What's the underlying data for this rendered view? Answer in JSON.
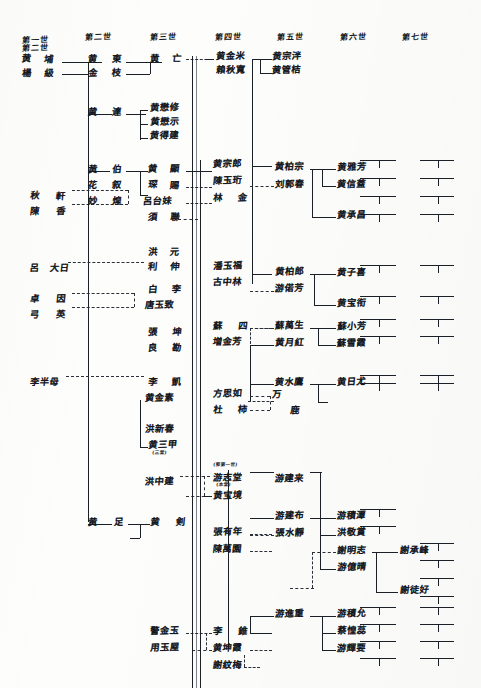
{
  "document": {
    "type": "handwritten-genealogy-chart",
    "script": "Chinese",
    "ink_color": "#1b1f28",
    "paper_color": "#fdfdfb"
  },
  "generation_headers": [
    {
      "label": "第一世",
      "x": 22,
      "y": 36
    },
    {
      "label": "第二世",
      "x": 22,
      "y": 44
    },
    {
      "label": "第二世",
      "x": 85,
      "y": 33
    },
    {
      "label": "第三世",
      "x": 150,
      "y": 33
    },
    {
      "label": "第四世",
      "x": 215,
      "y": 33
    },
    {
      "label": "第五世",
      "x": 277,
      "y": 33
    },
    {
      "label": "第六世",
      "x": 340,
      "y": 33
    },
    {
      "label": "第七世",
      "x": 402,
      "y": 33
    }
  ],
  "names": [
    {
      "text": "黄",
      "x": 22,
      "y": 55
    },
    {
      "text": "埔",
      "x": 44,
      "y": 55
    },
    {
      "text": "楊",
      "x": 22,
      "y": 69
    },
    {
      "text": "級",
      "x": 44,
      "y": 69
    },
    {
      "text": "黄",
      "x": 88,
      "y": 55
    },
    {
      "text": "東",
      "x": 112,
      "y": 55
    },
    {
      "text": "金",
      "x": 88,
      "y": 69
    },
    {
      "text": "枝",
      "x": 112,
      "y": 69
    },
    {
      "text": "黄",
      "x": 150,
      "y": 55
    },
    {
      "text": "亡",
      "x": 172,
      "y": 55
    },
    {
      "text": "黄宗泮",
      "x": 272,
      "y": 52
    },
    {
      "text": "黄管桔",
      "x": 272,
      "y": 66
    },
    {
      "text": "黄金米",
      "x": 216,
      "y": 52
    },
    {
      "text": "賴秋寬",
      "x": 216,
      "y": 66
    },
    {
      "text": "黄",
      "x": 88,
      "y": 108
    },
    {
      "text": "連",
      "x": 112,
      "y": 108
    },
    {
      "text": "黄懋修",
      "x": 150,
      "y": 104
    },
    {
      "text": "黄懋示",
      "x": 150,
      "y": 118
    },
    {
      "text": "黄得建",
      "x": 150,
      "y": 132
    },
    {
      "text": "黄",
      "x": 88,
      "y": 165
    },
    {
      "text": "伯",
      "x": 112,
      "y": 165
    },
    {
      "text": "花",
      "x": 88,
      "y": 181
    },
    {
      "text": "叙",
      "x": 112,
      "y": 181
    },
    {
      "text": "妙",
      "x": 88,
      "y": 197
    },
    {
      "text": "煌",
      "x": 112,
      "y": 197
    },
    {
      "text": "黄",
      "x": 148,
      "y": 165
    },
    {
      "text": "顯",
      "x": 170,
      "y": 165
    },
    {
      "text": "琛",
      "x": 148,
      "y": 181
    },
    {
      "text": "賜",
      "x": 170,
      "y": 181
    },
    {
      "text": "呂台妹",
      "x": 143,
      "y": 197
    },
    {
      "text": "須",
      "x": 148,
      "y": 213
    },
    {
      "text": "聯",
      "x": 170,
      "y": 213
    },
    {
      "text": "黄宗郎",
      "x": 213,
      "y": 160
    },
    {
      "text": "陳玉珩",
      "x": 213,
      "y": 177
    },
    {
      "text": "林",
      "x": 213,
      "y": 194
    },
    {
      "text": "金",
      "x": 238,
      "y": 194
    },
    {
      "text": "黄柏宗",
      "x": 275,
      "y": 163
    },
    {
      "text": "刘郭春",
      "x": 275,
      "y": 180
    },
    {
      "text": "黄雅芳",
      "x": 337,
      "y": 163
    },
    {
      "text": "黄信蓋",
      "x": 337,
      "y": 180
    },
    {
      "text": "黄承昌",
      "x": 337,
      "y": 211
    },
    {
      "text": "洪",
      "x": 148,
      "y": 248
    },
    {
      "text": "元",
      "x": 170,
      "y": 248
    },
    {
      "text": "利",
      "x": 148,
      "y": 263
    },
    {
      "text": "伸",
      "x": 170,
      "y": 263
    },
    {
      "text": "秋",
      "x": 30,
      "y": 192
    },
    {
      "text": "軒",
      "x": 56,
      "y": 192
    },
    {
      "text": "陳",
      "x": 30,
      "y": 207
    },
    {
      "text": "香",
      "x": 56,
      "y": 207
    },
    {
      "text": "呂",
      "x": 30,
      "y": 264
    },
    {
      "text": "大日",
      "x": 50,
      "y": 264
    },
    {
      "text": "卓",
      "x": 30,
      "y": 295
    },
    {
      "text": "因",
      "x": 56,
      "y": 295
    },
    {
      "text": "弓",
      "x": 30,
      "y": 311
    },
    {
      "text": "英",
      "x": 56,
      "y": 311
    },
    {
      "text": "白",
      "x": 148,
      "y": 285
    },
    {
      "text": "李",
      "x": 172,
      "y": 285
    },
    {
      "text": "唐玉致",
      "x": 145,
      "y": 301
    },
    {
      "text": "張",
      "x": 148,
      "y": 328
    },
    {
      "text": "坤",
      "x": 172,
      "y": 328
    },
    {
      "text": "良",
      "x": 148,
      "y": 344
    },
    {
      "text": "勘",
      "x": 172,
      "y": 344
    },
    {
      "text": "黄柏郎",
      "x": 275,
      "y": 268
    },
    {
      "text": "游偌芳",
      "x": 275,
      "y": 285
    },
    {
      "text": "黄子喜",
      "x": 337,
      "y": 268
    },
    {
      "text": "黄宝衔",
      "x": 337,
      "y": 299
    },
    {
      "text": "潘玉福",
      "x": 213,
      "y": 262
    },
    {
      "text": "古中林",
      "x": 213,
      "y": 278
    },
    {
      "text": "蘇",
      "x": 213,
      "y": 322
    },
    {
      "text": "四",
      "x": 238,
      "y": 322
    },
    {
      "text": "増金芳",
      "x": 213,
      "y": 338
    },
    {
      "text": "蘇萬生",
      "x": 275,
      "y": 322
    },
    {
      "text": "黄月紅",
      "x": 275,
      "y": 339
    },
    {
      "text": "蘇小芳",
      "x": 337,
      "y": 322
    },
    {
      "text": "蘇雪霞",
      "x": 337,
      "y": 339
    },
    {
      "text": "李半母",
      "x": 30,
      "y": 378
    },
    {
      "text": "李",
      "x": 148,
      "y": 378
    },
    {
      "text": "凱",
      "x": 172,
      "y": 378
    },
    {
      "text": "黄金素",
      "x": 145,
      "y": 394
    },
    {
      "text": "方思如",
      "x": 213,
      "y": 390
    },
    {
      "text": "杜",
      "x": 213,
      "y": 406
    },
    {
      "text": "柿",
      "x": 238,
      "y": 406
    },
    {
      "text": "万",
      "x": 272,
      "y": 390
    },
    {
      "text": "鹿",
      "x": 290,
      "y": 406
    },
    {
      "text": "黄水鷹",
      "x": 275,
      "y": 378
    },
    {
      "text": "黄日尤",
      "x": 337,
      "y": 378
    },
    {
      "text": "洪新春",
      "x": 145,
      "y": 425
    },
    {
      "text": "黄三甲",
      "x": 148,
      "y": 441
    },
    {
      "text": "洪中建",
      "x": 145,
      "y": 478
    },
    {
      "text": "游志堂",
      "x": 213,
      "y": 474
    },
    {
      "text": "黄宝境",
      "x": 213,
      "y": 492
    },
    {
      "text": "游建来",
      "x": 275,
      "y": 474
    },
    {
      "text": "黄",
      "x": 88,
      "y": 518
    },
    {
      "text": "足",
      "x": 114,
      "y": 518
    },
    {
      "text": "黄",
      "x": 150,
      "y": 518
    },
    {
      "text": "剣",
      "x": 176,
      "y": 518
    },
    {
      "text": "游建布",
      "x": 275,
      "y": 512
    },
    {
      "text": "張水靜",
      "x": 275,
      "y": 529
    },
    {
      "text": "游積潭",
      "x": 337,
      "y": 512
    },
    {
      "text": "洪敬賞",
      "x": 337,
      "y": 529
    },
    {
      "text": "謝明志",
      "x": 337,
      "y": 546
    },
    {
      "text": "游億晴",
      "x": 337,
      "y": 563
    },
    {
      "text": "謝承峰",
      "x": 400,
      "y": 546
    },
    {
      "text": "謝徒好",
      "x": 400,
      "y": 586
    },
    {
      "text": "張有年",
      "x": 213,
      "y": 528
    },
    {
      "text": "陳萬園",
      "x": 213,
      "y": 545
    },
    {
      "text": "游進重",
      "x": 275,
      "y": 610
    },
    {
      "text": "游積允",
      "x": 337,
      "y": 610
    },
    {
      "text": "蔡惶蕊",
      "x": 337,
      "y": 627
    },
    {
      "text": "游輝要",
      "x": 337,
      "y": 644
    },
    {
      "text": "李",
      "x": 213,
      "y": 627
    },
    {
      "text": "錐",
      "x": 238,
      "y": 627
    },
    {
      "text": "黄坤霞",
      "x": 213,
      "y": 644
    },
    {
      "text": "謝紋梅",
      "x": 213,
      "y": 661
    },
    {
      "text": "警金玉",
      "x": 150,
      "y": 627
    },
    {
      "text": "用玉屋",
      "x": 150,
      "y": 644
    }
  ],
  "annotations": [
    {
      "text": "(三堂)",
      "x": 152,
      "y": 452
    },
    {
      "text": "(郭第一世)",
      "x": 213,
      "y": 464
    },
    {
      "text": "(本堂)",
      "x": 216,
      "y": 484
    }
  ],
  "geometry": {
    "note": "Double vertical rule runs down the centre of the sheet at x≈192-200 from y≈55 to y≈688.",
    "center_spine_x": [
      192,
      196,
      200
    ],
    "right_stub_columns": [
      360,
      420
    ]
  }
}
